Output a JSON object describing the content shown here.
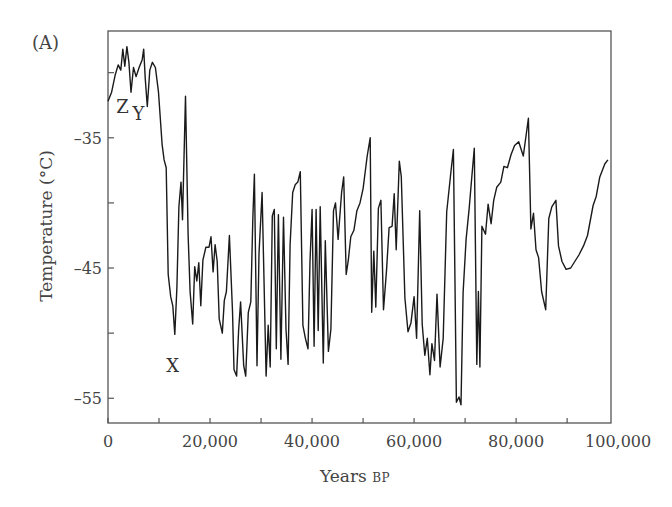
{
  "chart_data": {
    "type": "line",
    "panel_label": "(A)",
    "title": "",
    "xlabel": "Years",
    "xlabel_suffix": "BP",
    "ylabel": "Temperature (°C)",
    "xlim": [
      0,
      98600
    ],
    "ylim": [
      -56.9,
      -26.8
    ],
    "grid": false,
    "legend": null,
    "x_ticks": [
      0,
      10000,
      20000,
      30000,
      40000,
      50000,
      60000,
      70000,
      80000,
      90000
    ],
    "x_tick_labels": [
      {
        "value": 0,
        "label": "0"
      },
      {
        "value": 20000,
        "label": "20,000"
      },
      {
        "value": 40000,
        "label": "40,000"
      },
      {
        "value": 60000,
        "label": "60,000"
      },
      {
        "value": 80000,
        "label": "80,000"
      },
      {
        "value": 100000,
        "label": "100,000"
      }
    ],
    "y_ticks": [
      -30,
      -35,
      -40,
      -45,
      -50,
      -55
    ],
    "y_tick_labels": [
      {
        "value": -35,
        "label": "–35"
      },
      {
        "value": -45,
        "label": "–45"
      },
      {
        "value": -55,
        "label": "–55"
      }
    ],
    "annotations": [
      {
        "text": "Z",
        "x": 2800,
        "y": -32.6
      },
      {
        "text": "Y",
        "x": 6000,
        "y": -33.2
      },
      {
        "text": "X",
        "x": 12600,
        "y": -52.5
      }
    ],
    "series": [
      {
        "name": "Temperature",
        "color": "#1a1a1a",
        "x": [
          0,
          700,
          1400,
          2000,
          2500,
          2900,
          3300,
          3700,
          4100,
          4500,
          5000,
          5500,
          6100,
          6700,
          7000,
          7300,
          7700,
          8200,
          8700,
          9300,
          9900,
          10600,
          11000,
          11400,
          11800,
          12300,
          12700,
          13100,
          13500,
          13900,
          14300,
          14600,
          15200,
          15700,
          16100,
          16600,
          17000,
          17400,
          17800,
          18200,
          18600,
          19200,
          19800,
          20200,
          20600,
          21000,
          21400,
          21800,
          22400,
          22800,
          23200,
          23800,
          24400,
          24700,
          25200,
          25600,
          26000,
          26600,
          27000,
          27500,
          28000,
          28400,
          28700,
          29200,
          29600,
          30200,
          31000,
          31400,
          31800,
          32200,
          32600,
          33000,
          33400,
          33900,
          34400,
          34900,
          35300,
          35700,
          36200,
          36700,
          37200,
          37700,
          38200,
          38700,
          39200,
          39600,
          40000,
          40400,
          40800,
          41200,
          41600,
          42200,
          42600,
          43200,
          43700,
          44200,
          44600,
          45100,
          45800,
          46200,
          46700,
          47100,
          47600,
          48200,
          48800,
          49400,
          50000,
          50800,
          51400,
          51700,
          52100,
          52500,
          53000,
          53500,
          54000,
          54600,
          55100,
          55700,
          56100,
          56500,
          57100,
          57500,
          58200,
          58800,
          59400,
          60000,
          60500,
          61100,
          61600,
          62100,
          62600,
          63100,
          63500,
          64000,
          64500,
          65100,
          65700,
          66400,
          67200,
          67700,
          68300,
          68800,
          69200,
          69600,
          70200,
          70800,
          71300,
          71800,
          72300,
          72600,
          72900,
          73300,
          74000,
          74500,
          75100,
          75600,
          76200,
          77000,
          77600,
          78300,
          79000,
          79700,
          80500,
          81400,
          82400,
          82900,
          83400,
          83900,
          84400,
          85000,
          85800,
          86400,
          87000,
          87800,
          88300,
          89000,
          89800,
          90700,
          91500,
          92300,
          93200,
          94000,
          95100,
          95700,
          96400,
          97400,
          98000
        ],
        "y": [
          -32.2,
          -31.5,
          -30.2,
          -29.4,
          -29.8,
          -28.2,
          -29.5,
          -28.0,
          -29.2,
          -31.5,
          -29.6,
          -30.3,
          -29.6,
          -29.0,
          -28.2,
          -30.4,
          -32.6,
          -29.8,
          -29.2,
          -29.6,
          -31.5,
          -35.5,
          -36.7,
          -37.3,
          -45.5,
          -47.2,
          -47.9,
          -50.1,
          -46.5,
          -40.3,
          -38.4,
          -41.3,
          -31.8,
          -42.4,
          -46.8,
          -49.3,
          -44.9,
          -46.0,
          -44.6,
          -47.9,
          -44.4,
          -43.4,
          -43.4,
          -42.6,
          -45.3,
          -43.2,
          -44.5,
          -48.9,
          -50.0,
          -47.5,
          -46.8,
          -42.5,
          -48.3,
          -52.8,
          -53.3,
          -49.8,
          -47.6,
          -52.5,
          -53.3,
          -48.4,
          -47.6,
          -41.0,
          -37.8,
          -52.5,
          -43.9,
          -39.2,
          -53.3,
          -49.4,
          -52.6,
          -41.0,
          -40.5,
          -51.2,
          -40.9,
          -52.0,
          -41.1,
          -49.7,
          -52.4,
          -43.2,
          -39.2,
          -38.6,
          -38.4,
          -37.6,
          -49.4,
          -50.4,
          -51.2,
          -44.5,
          -40.5,
          -51.0,
          -40.5,
          -49.8,
          -40.3,
          -52.3,
          -42.9,
          -51.4,
          -49.7,
          -40.6,
          -40.0,
          -42.8,
          -39.2,
          -38.0,
          -45.5,
          -44.4,
          -42.6,
          -42.1,
          -40.6,
          -40.0,
          -38.9,
          -36.4,
          -35.0,
          -48.4,
          -43.7,
          -48.0,
          -40.4,
          -39.8,
          -48.2,
          -45.2,
          -41.9,
          -41.8,
          -39.3,
          -43.6,
          -36.8,
          -38.0,
          -47.3,
          -49.9,
          -49.2,
          -47.2,
          -50.4,
          -40.6,
          -49.3,
          -51.7,
          -50.4,
          -53.2,
          -50.8,
          -52.1,
          -47.0,
          -52.6,
          -50.4,
          -40.7,
          -37.7,
          -35.9,
          -55.3,
          -54.9,
          -55.5,
          -46.9,
          -42.8,
          -40.4,
          -38.1,
          -35.8,
          -52.4,
          -46.8,
          -52.6,
          -41.8,
          -42.4,
          -40.1,
          -41.6,
          -39.8,
          -38.8,
          -38.4,
          -37.2,
          -37.3,
          -36.3,
          -35.6,
          -35.3,
          -36.4,
          -33.5,
          -42.0,
          -40.8,
          -43.6,
          -44.2,
          -46.8,
          -48.2,
          -41.2,
          -40.3,
          -39.8,
          -43.3,
          -44.5,
          -45.1,
          -45.0,
          -44.5,
          -44.0,
          -43.3,
          -42.5,
          -40.2,
          -39.5,
          -38.0,
          -37.0,
          -36.7
        ]
      }
    ]
  },
  "labels": {
    "panel": "(A)",
    "ylabel": "Temperature (°C)",
    "xlabel": "Years",
    "xlabel_suffix": "BP"
  }
}
